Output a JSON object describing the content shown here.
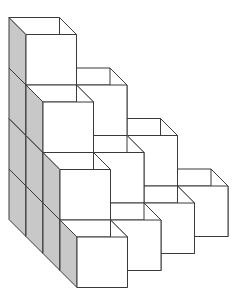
{
  "diagram": {
    "type": "isometric-cube-staircase",
    "cube_size": 50.5,
    "depth_offset": [
      17,
      17
    ],
    "origin_front_top_left_level0": [
      26,
      186
    ],
    "rows_back_to_front": [
      {
        "row": 0,
        "column_heights": [
          4,
          3,
          2,
          1
        ]
      },
      {
        "row": 1,
        "column_heights": [
          3,
          2,
          1
        ]
      },
      {
        "row": 2,
        "column_heights": [
          2,
          1
        ]
      },
      {
        "row": 3,
        "column_heights": [
          1
        ]
      }
    ],
    "total_cubes": 20,
    "colors": {
      "face_front": "#ffffff",
      "face_top": "#ffffff",
      "face_right": "#ffffff",
      "face_left_shaded": "#c8c8c8",
      "stroke": "#3a3a3a"
    }
  }
}
